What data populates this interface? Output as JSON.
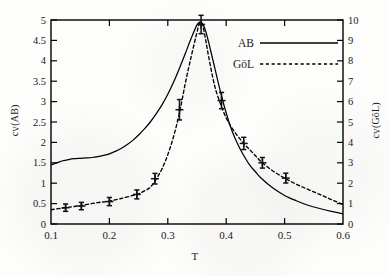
{
  "figure": {
    "xlabel": "T",
    "ylabel_left_prefix": "c",
    "ylabel_left_sub": "V",
    "ylabel_left_suffix": "(AB)",
    "ylabel_right_prefix": "c",
    "ylabel_right_sub": "V",
    "ylabel_right_suffix": "(GōL)",
    "frame_color": "#000000",
    "curve_color": "#000000"
  },
  "legend": {
    "position": "upper-right-inside",
    "entries": [
      {
        "label": "AB",
        "style": "solid"
      },
      {
        "label": "GōL",
        "style": "dashed"
      }
    ]
  },
  "chart_data": {
    "type": "line",
    "title": "",
    "xlabel": "T",
    "ylabel": "c_V(AB)",
    "ylabel_right": "c_V(GōL)",
    "grid": false,
    "legend_position": "upper right",
    "xlim": [
      0.1,
      0.6
    ],
    "ylim": [
      0,
      5
    ],
    "ylim_right": [
      0,
      10
    ],
    "xticks": [
      0.1,
      0.2,
      0.3,
      0.4,
      0.5,
      0.6
    ],
    "xtick_labels": [
      "0.1",
      "0.2",
      "0.3",
      "0.4",
      "0.5",
      "0.6"
    ],
    "yticks_left": [
      0,
      0.5,
      1,
      1.5,
      2,
      2.5,
      3,
      3.5,
      4,
      4.5,
      5
    ],
    "ytick_labels_left": [
      "0",
      "0.5",
      "1",
      "1.5",
      "2",
      "2.5",
      "3",
      "3.5",
      "4",
      "4.5",
      "5"
    ],
    "yticks_right": [
      0,
      1,
      2,
      3,
      4,
      5,
      6,
      7,
      8,
      9,
      10
    ],
    "ytick_labels_right": [
      "0",
      "1",
      "2",
      "3",
      "4",
      "5",
      "6",
      "7",
      "8",
      "9",
      "10"
    ],
    "series": [
      {
        "name": "AB",
        "style": "solid",
        "axis": "left",
        "x": [
          0.1,
          0.11,
          0.12,
          0.13,
          0.14,
          0.15,
          0.16,
          0.17,
          0.18,
          0.19,
          0.2,
          0.21,
          0.22,
          0.23,
          0.24,
          0.25,
          0.26,
          0.27,
          0.28,
          0.29,
          0.3,
          0.31,
          0.32,
          0.33,
          0.34,
          0.35,
          0.355,
          0.36,
          0.365,
          0.37,
          0.38,
          0.39,
          0.4,
          0.41,
          0.42,
          0.43,
          0.44,
          0.45,
          0.46,
          0.48,
          0.5,
          0.52,
          0.54,
          0.56,
          0.58,
          0.6
        ],
        "y": [
          1.45,
          1.5,
          1.55,
          1.58,
          1.6,
          1.61,
          1.62,
          1.63,
          1.65,
          1.68,
          1.72,
          1.78,
          1.85,
          1.94,
          2.05,
          2.18,
          2.33,
          2.5,
          2.7,
          2.92,
          3.18,
          3.48,
          3.82,
          4.18,
          4.55,
          4.88,
          4.95,
          4.9,
          4.72,
          4.45,
          3.85,
          3.25,
          2.72,
          2.28,
          1.95,
          1.68,
          1.45,
          1.28,
          1.12,
          0.88,
          0.7,
          0.57,
          0.46,
          0.38,
          0.31,
          0.25
        ]
      },
      {
        "name": "GōL",
        "style": "dashed",
        "axis": "right",
        "x": [
          0.1,
          0.12,
          0.14,
          0.16,
          0.18,
          0.2,
          0.22,
          0.24,
          0.25,
          0.26,
          0.27,
          0.28,
          0.29,
          0.3,
          0.31,
          0.32,
          0.33,
          0.34,
          0.35,
          0.355,
          0.36,
          0.365,
          0.37,
          0.38,
          0.39,
          0.4,
          0.41,
          0.42,
          0.43,
          0.44,
          0.45,
          0.46,
          0.48,
          0.5,
          0.52,
          0.54,
          0.56,
          0.58,
          0.6
        ],
        "y_right": [
          0.7,
          0.78,
          0.86,
          0.95,
          1.05,
          1.12,
          1.25,
          1.4,
          1.48,
          1.62,
          1.8,
          2.2,
          2.7,
          3.4,
          4.3,
          5.45,
          6.9,
          8.2,
          9.4,
          9.9,
          9.7,
          9.0,
          8.2,
          6.8,
          5.9,
          5.2,
          4.7,
          4.3,
          3.95,
          3.65,
          3.35,
          3.05,
          2.6,
          2.25,
          1.95,
          1.7,
          1.45,
          1.2,
          0.95
        ]
      }
    ],
    "markers": {
      "series": "GōL",
      "symbol": "+",
      "axis": "right",
      "points": [
        {
          "x": 0.125,
          "y_right": 0.8,
          "yerr": 0.18
        },
        {
          "x": 0.152,
          "y_right": 0.88,
          "yerr": 0.18
        },
        {
          "x": 0.2,
          "y_right": 1.1,
          "yerr": 0.2
        },
        {
          "x": 0.247,
          "y_right": 1.45,
          "yerr": 0.22
        },
        {
          "x": 0.278,
          "y_right": 2.22,
          "yerr": 0.26
        },
        {
          "x": 0.32,
          "y_right": 5.6,
          "yerr": 0.5
        },
        {
          "x": 0.357,
          "y_right": 9.78,
          "yerr": 0.45
        },
        {
          "x": 0.392,
          "y_right": 6.05,
          "yerr": 0.4
        },
        {
          "x": 0.43,
          "y_right": 3.95,
          "yerr": 0.3
        },
        {
          "x": 0.462,
          "y_right": 3.0,
          "yerr": 0.26
        },
        {
          "x": 0.502,
          "y_right": 2.25,
          "yerr": 0.24
        }
      ]
    }
  }
}
